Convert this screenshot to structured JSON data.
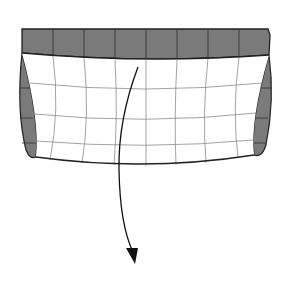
{
  "diagram": {
    "colors": {
      "background": "#ffffff",
      "shaded_band": "#7a7a7a",
      "outline": "#222222",
      "grid": "#8c8c8c",
      "surface": "#ffffff",
      "arrow": "#111111"
    },
    "top_band": {
      "segments": 8
    },
    "grid": {
      "columns": 8,
      "rows": 4
    },
    "arrow": {
      "direction": "down",
      "label": ""
    }
  }
}
